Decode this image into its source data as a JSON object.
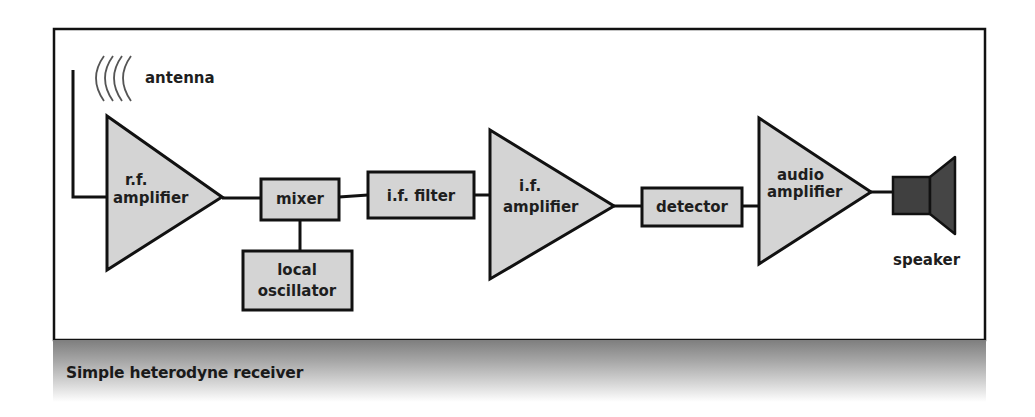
{
  "caption": "Simple heterodyne receiver",
  "colors": {
    "block_fill": "#d4d4d4",
    "speaker_fill": "#404040",
    "stroke": "#111111",
    "frame": "#111111",
    "caption_band_top": "#7e7e7e"
  },
  "diagram": {
    "antenna": {
      "label": "antenna",
      "icon": "radio-waves-icon"
    },
    "blocks": [
      {
        "id": "rf_amp",
        "shape": "triangle",
        "line1": "r.f.",
        "line2": "amplifier"
      },
      {
        "id": "mixer",
        "shape": "box",
        "label": "mixer"
      },
      {
        "id": "local_osc",
        "shape": "box",
        "line1": "local",
        "line2": "oscillator"
      },
      {
        "id": "if_filter",
        "shape": "box",
        "label": "i.f. filter"
      },
      {
        "id": "if_amp",
        "shape": "triangle",
        "line1": "i.f.",
        "line2": "amplifier"
      },
      {
        "id": "detector",
        "shape": "box",
        "label": "detector"
      },
      {
        "id": "audio_amp",
        "shape": "triangle",
        "line1": "audio",
        "line2": "amplifier"
      }
    ],
    "speaker": {
      "label": "speaker",
      "icon": "speaker-icon"
    },
    "connections": [
      [
        "antenna",
        "rf_amp"
      ],
      [
        "rf_amp",
        "mixer"
      ],
      [
        "local_osc",
        "mixer"
      ],
      [
        "mixer",
        "if_filter"
      ],
      [
        "if_filter",
        "if_amp"
      ],
      [
        "if_amp",
        "detector"
      ],
      [
        "detector",
        "audio_amp"
      ],
      [
        "audio_amp",
        "speaker"
      ]
    ]
  }
}
